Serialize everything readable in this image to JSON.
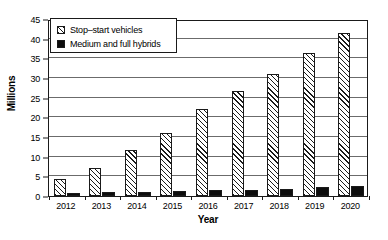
{
  "chart_data": {
    "type": "bar",
    "title": "",
    "xlabel": "Year",
    "ylabel": "Millions",
    "categories": [
      "2012",
      "2013",
      "2014",
      "2015",
      "2016",
      "2017",
      "2018",
      "2019",
      "2020"
    ],
    "series": [
      {
        "name": "Stop–start vehicles",
        "fill": "hatch",
        "values": [
          4.3,
          7.0,
          11.8,
          16.1,
          22.0,
          26.7,
          31.0,
          36.4,
          41.5
        ]
      },
      {
        "name": "Medium and full hybrids",
        "fill": "solid",
        "values": [
          0.8,
          0.9,
          1.0,
          1.2,
          1.5,
          1.6,
          1.8,
          2.3,
          2.5
        ]
      }
    ],
    "ylim": [
      0,
      45
    ],
    "ytick_step": 5,
    "yticks": [
      0,
      5,
      10,
      15,
      20,
      25,
      30,
      35,
      40,
      45
    ],
    "ytick_labels": [
      "0",
      "5",
      "10",
      "15",
      "20",
      "25",
      "30",
      "35",
      "40",
      "45"
    ],
    "grid": true,
    "legend_position": "top-left",
    "colors": {
      "hatch_line": "#1a1a1a",
      "hatch_bg": "#ffffff",
      "solid": "#0d0d0d",
      "axis": "#1a1a1a",
      "grid": "#6b6b6b"
    }
  },
  "legend": {
    "items": [
      {
        "label": "Stop–start vehicles"
      },
      {
        "label": "Medium and full hybrids"
      }
    ]
  }
}
